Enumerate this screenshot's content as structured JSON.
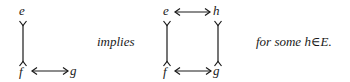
{
  "diagram": {
    "left": {
      "nodes": {
        "top": "e",
        "bottom": "f",
        "bottom_right": "g"
      },
      "edges": [
        {
          "from": "e",
          "to": "f",
          "type": "vertical-tail-head"
        },
        {
          "from": "f",
          "to": "g",
          "type": "double-arrow"
        }
      ]
    },
    "connector": "implies",
    "right": {
      "nodes": {
        "top_left": "e",
        "top_right": "h",
        "bottom_left": "f",
        "bottom_right": "g"
      },
      "edges": [
        {
          "from": "e",
          "to": "h",
          "type": "double-arrow"
        },
        {
          "from": "e",
          "to": "f",
          "type": "vertical-tail-head"
        },
        {
          "from": "h",
          "to": "g",
          "type": "vertical-tail-head"
        },
        {
          "from": "f",
          "to": "g",
          "type": "double-arrow"
        }
      ]
    },
    "condition": "for some h∈E."
  }
}
